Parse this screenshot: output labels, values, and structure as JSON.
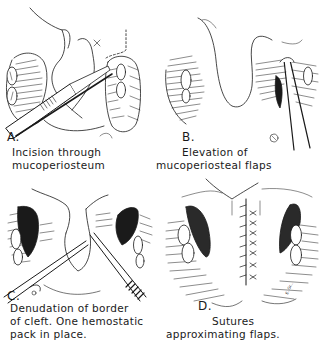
{
  "figure": {
    "panels": [
      {
        "id": "A",
        "letter": "A.",
        "caption_lines": [
          "Incision through",
          "mucoperiosteum"
        ]
      },
      {
        "id": "B",
        "letter": "B.",
        "caption_lines": [
          "Elevation of",
          "mucoperiosteal flaps"
        ]
      },
      {
        "id": "C",
        "letter": "C.",
        "caption_lines": [
          "Denudation of border",
          "of cleft. One hemostatic",
          "pack in place."
        ]
      },
      {
        "id": "D",
        "letter": "D.",
        "caption_lines": [
          "Sutures",
          "approximating flaps."
        ]
      }
    ],
    "signature": "E. Gr..."
  },
  "colors": {
    "ink": "#1a1a1a",
    "paper": "#ffffff"
  }
}
